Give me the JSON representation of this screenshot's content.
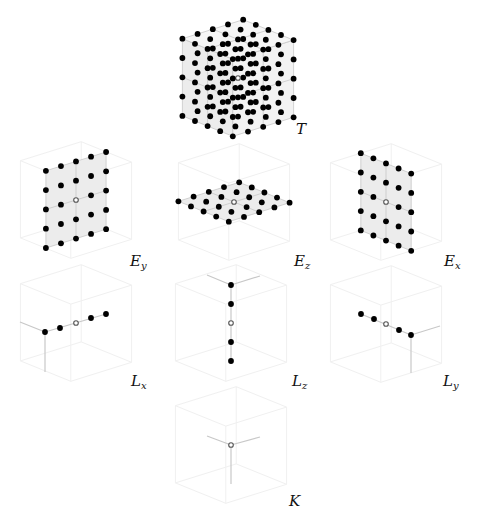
{
  "diagram": {
    "colors": {
      "point_fill": "#000000",
      "hollow_stroke": "#555555",
      "face_fill": "#ececec",
      "edge": "#c8c8c8",
      "ghost": "#f0f0f0",
      "label": "#111111"
    },
    "panels": [
      {
        "id": "T",
        "label": "T",
        "sub": "",
        "description": "Full 5x5x5 lattice with one hollow center point",
        "points": 124,
        "hollow": 1
      },
      {
        "id": "Ey",
        "label": "E",
        "sub": "y",
        "description": "5x5 planar lattice (vertical, y-plane) with hollow center",
        "points": 24,
        "hollow": 1
      },
      {
        "id": "Ez",
        "label": "E",
        "sub": "z",
        "description": "5x5 planar lattice (horizontal, z-plane) with hollow center",
        "points": 24,
        "hollow": 1
      },
      {
        "id": "Ex",
        "label": "E",
        "sub": "x",
        "description": "5x5 planar lattice (vertical, x-plane) with hollow center",
        "points": 24,
        "hollow": 1
      },
      {
        "id": "Lx",
        "label": "L",
        "sub": "x",
        "description": "Line of 5 points along x with hollow center",
        "points": 4,
        "hollow": 1
      },
      {
        "id": "Lz",
        "label": "L",
        "sub": "z",
        "description": "Line of 5 points along z with hollow center",
        "points": 4,
        "hollow": 1
      },
      {
        "id": "Ly",
        "label": "L",
        "sub": "y",
        "description": "Line of 5 points along y with hollow center",
        "points": 4,
        "hollow": 1
      },
      {
        "id": "K",
        "label": "K",
        "sub": "",
        "description": "Single hollow point at origin",
        "points": 0,
        "hollow": 1
      }
    ]
  }
}
